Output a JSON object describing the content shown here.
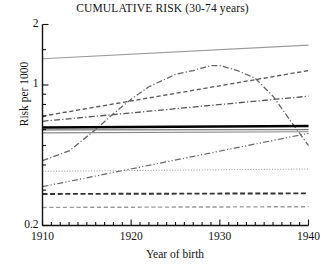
{
  "chart_data": {
    "type": "line",
    "title": "CUMULATIVE RISK (30-74 years)",
    "xlabel": "Year of birth",
    "ylabel": "Risk per 1000",
    "xlim": [
      1910,
      1940
    ],
    "ylim": [
      0.2,
      2
    ],
    "yscale": "log",
    "grid": false,
    "legend": "none",
    "xticks": [
      1910,
      1920,
      1930,
      1940
    ],
    "xtick_labels": [
      "1910",
      "1920",
      "1930",
      "1940"
    ],
    "xminor_tick_step": 1,
    "yticks": [
      0.2,
      1,
      2
    ],
    "ytick_labels": [
      "0.2",
      "1",
      "2"
    ],
    "series": [
      {
        "name": "series-1-top-solid-light",
        "style": "solid",
        "color": "#9a9a9a",
        "width": 1.1,
        "x": [
          1910,
          1940
        ],
        "values": [
          1.35,
          1.58
        ]
      },
      {
        "name": "series-2-dashed-rising",
        "style": "dashed",
        "color": "#555555",
        "width": 1.3,
        "x": [
          1910,
          1940
        ],
        "values": [
          0.7,
          1.18
        ]
      },
      {
        "name": "series-3-dashdot-rising",
        "style": "dashdot",
        "color": "#555555",
        "width": 1.3,
        "x": [
          1910,
          1940
        ],
        "values": [
          0.66,
          0.88
        ]
      },
      {
        "name": "series-4-dashdot-peaked",
        "style": "dashdot",
        "color": "#666666",
        "width": 1.3,
        "x": [
          1910,
          1913,
          1916,
          1918,
          1920,
          1922,
          1925,
          1927,
          1929,
          1930,
          1932,
          1934,
          1936,
          1938,
          1940
        ],
        "values": [
          0.42,
          0.47,
          0.6,
          0.72,
          0.85,
          0.98,
          1.13,
          1.18,
          1.25,
          1.25,
          1.18,
          1.08,
          0.88,
          0.66,
          0.5
        ]
      },
      {
        "name": "series-5-thick-black-flat",
        "style": "solid",
        "color": "#000000",
        "width": 2.6,
        "x": [
          1910,
          1940
        ],
        "values": [
          0.615,
          0.625
        ]
      },
      {
        "name": "series-6-gray-flat-upper",
        "style": "solid",
        "color": "#777777",
        "width": 1.1,
        "x": [
          1910,
          1940
        ],
        "values": [
          0.598,
          0.6
        ]
      },
      {
        "name": "series-7-gray-flat-lower",
        "style": "solid",
        "color": "#888888",
        "width": 1.1,
        "x": [
          1910,
          1940
        ],
        "values": [
          0.578,
          0.585
        ]
      },
      {
        "name": "series-8-dashdotdot-rising",
        "style": "dashdotdot",
        "color": "#666666",
        "width": 1.2,
        "x": [
          1910,
          1940
        ],
        "values": [
          0.312,
          0.575
        ]
      },
      {
        "name": "series-9-dotted-flat",
        "style": "dotted",
        "color": "#999999",
        "width": 1.0,
        "x": [
          1910,
          1940
        ],
        "values": [
          0.372,
          0.382
        ]
      },
      {
        "name": "series-10-heavy-dashed-flat",
        "style": "dashed",
        "color": "#333333",
        "width": 1.9,
        "x": [
          1910,
          1940
        ],
        "values": [
          0.287,
          0.289
        ]
      },
      {
        "name": "series-11-light-dashed-flat",
        "style": "dashed",
        "color": "#9a9a9a",
        "width": 1.4,
        "x": [
          1910,
          1940
        ],
        "values": [
          0.246,
          0.248
        ]
      }
    ]
  }
}
